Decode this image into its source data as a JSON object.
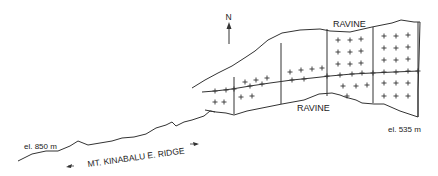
{
  "map": {
    "north_label": "N",
    "labels": {
      "ravine_north": "RAVINE",
      "ravine_south": "RAVINE",
      "elevation_top": "el. 850 m",
      "elevation_bottom": "el. 535 m",
      "ridge": "MT. KINABALU E. RIDGE"
    },
    "colors": {
      "stroke": "#333333",
      "text": "#222222",
      "background": "#ffffff"
    },
    "icons": [
      "north-arrow-icon",
      "direction-arrow-left-icon",
      "direction-arrow-right-icon",
      "plot-marker-plus-icon"
    ]
  }
}
